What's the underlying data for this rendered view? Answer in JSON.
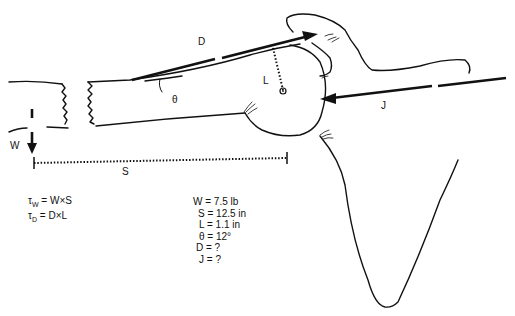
{
  "diagram": {
    "labels": {
      "deltoid_force": "D",
      "moment_arm": "L",
      "angle": "θ",
      "joint_reaction": "J",
      "weight": "W",
      "weight_distance": "S"
    },
    "equations": [
      {
        "symbol": "τ",
        "subscript": "W",
        "expression": "= W×S"
      },
      {
        "symbol": "τ",
        "subscript": "D",
        "expression": "= D×L"
      }
    ],
    "given_values": [
      "W = 7.5 lb",
      "S = 12.5 in",
      "L = 1.1 in",
      "θ = 12°",
      "D = ?",
      "J = ?"
    ]
  }
}
